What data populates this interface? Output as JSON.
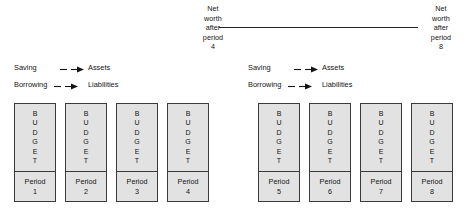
{
  "diagram": {
    "panels": [
      {
        "id": "panel-periods-1-4",
        "networth": {
          "lines": [
            "Net",
            "worth",
            "after",
            "period",
            "4"
          ]
        },
        "legend": [
          {
            "source": "Saving",
            "target": "Assets",
            "arrow": "dashed-arrow-icon"
          },
          {
            "source": "Borrowing",
            "target": "Liabilities",
            "arrow": "dashed-arrow-icon"
          }
        ],
        "boxes": [
          {
            "title": "BUDGET",
            "letters": [
              "B",
              "U",
              "D",
              "G",
              "E",
              "T"
            ],
            "period_label": "Period",
            "period_number": "1"
          },
          {
            "title": "BUDGET",
            "letters": [
              "B",
              "U",
              "D",
              "G",
              "E",
              "T"
            ],
            "period_label": "Period",
            "period_number": "2"
          },
          {
            "title": "BUDGET",
            "letters": [
              "B",
              "U",
              "D",
              "G",
              "E",
              "T"
            ],
            "period_label": "Period",
            "period_number": "3"
          },
          {
            "title": "BUDGET",
            "letters": [
              "B",
              "U",
              "D",
              "G",
              "E",
              "T"
            ],
            "period_label": "Period",
            "period_number": "4"
          }
        ]
      },
      {
        "id": "panel-periods-5-8",
        "networth": {
          "lines": [
            "Net",
            "worth",
            "after",
            "period",
            "8"
          ]
        },
        "legend": [
          {
            "source": "Saving",
            "target": "Assets",
            "arrow": "dashed-arrow-icon"
          },
          {
            "source": "Borrowing",
            "target": "Liabilities",
            "arrow": "dashed-arrow-icon"
          }
        ],
        "boxes": [
          {
            "title": "BUDGET",
            "letters": [
              "B",
              "U",
              "D",
              "G",
              "E",
              "T"
            ],
            "period_label": "Period",
            "period_number": "5"
          },
          {
            "title": "BUDGET",
            "letters": [
              "B",
              "U",
              "D",
              "G",
              "E",
              "T"
            ],
            "period_label": "Period",
            "period_number": "6"
          },
          {
            "title": "BUDGET",
            "letters": [
              "B",
              "U",
              "D",
              "G",
              "E",
              "T"
            ],
            "period_label": "Period",
            "period_number": "7"
          },
          {
            "title": "BUDGET",
            "letters": [
              "B",
              "U",
              "D",
              "G",
              "E",
              "T"
            ],
            "period_label": "Period",
            "period_number": "8"
          }
        ]
      }
    ],
    "connector": {
      "name": "timeline-connector",
      "style": "solid-line"
    },
    "colors": {
      "box_fill": "#e2e2e2",
      "box_border": "#3a3a3a",
      "text": "#141414",
      "line": "#222222",
      "background": "#ffffff"
    }
  }
}
